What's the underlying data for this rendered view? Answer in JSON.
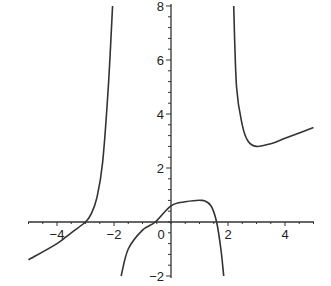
{
  "chart_data": {
    "type": "line",
    "title": "",
    "xlabel": "",
    "ylabel": "",
    "xlim": [
      -5,
      5
    ],
    "ylim": [
      -2,
      8
    ],
    "grid": false,
    "legend": null,
    "x_ticks": [
      "-4",
      "-2",
      "2",
      "4"
    ],
    "y_ticks": [
      "-2",
      "2",
      "4",
      "6",
      "8"
    ],
    "origin_label": "0",
    "vertical_asymptotes": [
      -2.0,
      2.2
    ],
    "series": [
      {
        "name": "left branch",
        "x": [
          -5,
          -4,
          -3.5,
          -3,
          -2.8,
          -2.6,
          -2.4,
          -2.2,
          -2.05
        ],
        "y": [
          -1.4,
          -0.8,
          -0.4,
          0.0,
          0.3,
          0.9,
          2.2,
          5.0,
          8.0
        ]
      },
      {
        "name": "middle branch",
        "x": [
          -1.75,
          -1.5,
          -1.0,
          -0.55,
          0.0,
          0.5,
          1.1,
          1.4,
          1.6,
          1.75,
          1.85
        ],
        "y": [
          -2.0,
          -1.0,
          -0.3,
          0.0,
          0.6,
          0.75,
          0.8,
          0.6,
          0.0,
          -1.0,
          -2.0
        ]
      },
      {
        "name": "right branch",
        "x": [
          2.2,
          2.3,
          2.5,
          2.7,
          3.0,
          3.5,
          4.0,
          4.5,
          5.0
        ],
        "y": [
          8.0,
          5.0,
          3.6,
          3.0,
          2.8,
          2.9,
          3.1,
          3.3,
          3.5
        ]
      }
    ]
  }
}
